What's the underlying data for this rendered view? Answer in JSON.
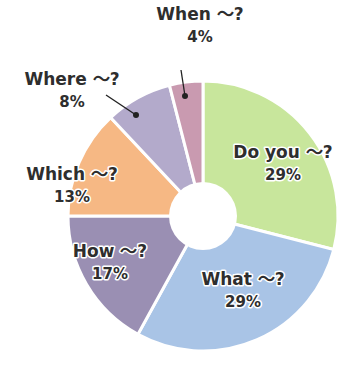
{
  "chart_data": {
    "type": "pie",
    "donut": true,
    "title": "",
    "start_angle_deg": 0,
    "direction": "clockwise",
    "slices": [
      {
        "label": "Do you ～?",
        "value": 29,
        "pct_label": "29%",
        "color": "#c8e69c"
      },
      {
        "label": "What ～?",
        "value": 29,
        "pct_label": "29%",
        "color": "#a9c4e6"
      },
      {
        "label": "How ～?",
        "value": 17,
        "pct_label": "17%",
        "color": "#9a8fb3"
      },
      {
        "label": "Which ～?",
        "value": 13,
        "pct_label": "13%",
        "color": "#f6b884"
      },
      {
        "label": "Where ～?",
        "value": 8,
        "pct_label": "8%",
        "color": "#b3aacb"
      },
      {
        "label": "When ～?",
        "value": 4,
        "pct_label": "4%",
        "color": "#c99ab0"
      }
    ]
  },
  "labels": [
    {
      "name": "Do you ～?",
      "pct": "29%",
      "x": 283,
      "y": 158,
      "py": 180
    },
    {
      "name": "What ～?",
      "pct": "29%",
      "x": 243,
      "y": 285,
      "py": 307
    },
    {
      "name": "How ～?",
      "pct": "17%",
      "x": 110,
      "y": 257,
      "py": 279
    },
    {
      "name": "Which ～?",
      "pct": "13%",
      "x": 72,
      "y": 180,
      "py": 202
    },
    {
      "name": "Where ～?",
      "pct": "8%",
      "x": 72,
      "y": 85,
      "py": 107
    },
    {
      "name": "When ～?",
      "pct": "4%",
      "x": 200,
      "y": 20,
      "py": 42
    }
  ],
  "leaders": [
    {
      "x1": 106,
      "y1": 95,
      "x2": 136,
      "y2": 115
    },
    {
      "x1": 181,
      "y1": 70,
      "x2": 185,
      "y2": 96
    }
  ]
}
